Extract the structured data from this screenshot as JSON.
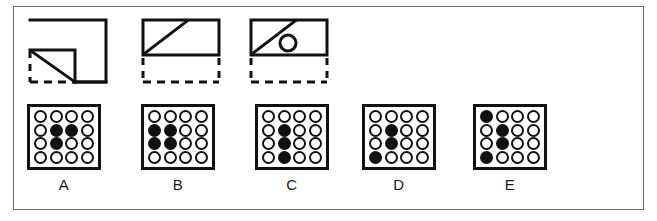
{
  "page": {
    "width": 657,
    "height": 221,
    "background": "#ffffff",
    "frame_color": "#6f6f6f",
    "ink_color": "#111111"
  },
  "prompt": {
    "name": "prompt-figure-sequence",
    "count": 3,
    "figures": [
      {
        "id": "figure-1",
        "description": "square outline with notched bottom-left corner, diagonal line across the notch, dashed lines completing the missing corner",
        "left": 22,
        "width": 88,
        "height": 72,
        "solid_parts": [
          "outer-square-top",
          "outer-square-right",
          "outer-square-bottom-right",
          "inner-notch-horizontal",
          "inner-notch-vertical",
          "diagonal"
        ],
        "dashed_parts": [
          "left-edge-lower",
          "bottom-edge-left"
        ],
        "has_circle": false
      },
      {
        "id": "figure-2",
        "description": "rectangle outline with diagonal line from bottom-left to top edge, dashed rectangle below",
        "left": 135,
        "width": 84,
        "height": 72,
        "solid_parts": [
          "rectangle",
          "diagonal"
        ],
        "dashed_parts": [
          "lower-box-left",
          "lower-box-right",
          "lower-box-bottom"
        ],
        "has_circle": false
      },
      {
        "id": "figure-3",
        "description": "rectangle outline with diagonal line and small circle, dashed rectangle below",
        "left": 243,
        "width": 84,
        "height": 72,
        "solid_parts": [
          "rectangle",
          "diagonal",
          "circle"
        ],
        "dashed_parts": [
          "lower-box-left",
          "lower-box-right",
          "lower-box-bottom"
        ],
        "has_circle": true
      }
    ]
  },
  "options": {
    "name": "answer-options",
    "grid_rows": 4,
    "grid_cols": 4,
    "legend": {
      "filled": "black dot",
      "empty": "white dot"
    },
    "items": [
      {
        "label": "A",
        "left": 22,
        "grid": [
          [
            0,
            0,
            0,
            0
          ],
          [
            0,
            1,
            1,
            0
          ],
          [
            0,
            1,
            0,
            0
          ],
          [
            0,
            0,
            0,
            0
          ]
        ]
      },
      {
        "label": "B",
        "left": 136,
        "grid": [
          [
            0,
            0,
            0,
            0
          ],
          [
            1,
            1,
            0,
            0
          ],
          [
            1,
            1,
            0,
            0
          ],
          [
            0,
            0,
            0,
            0
          ]
        ]
      },
      {
        "label": "C",
        "left": 250,
        "grid": [
          [
            0,
            0,
            0,
            0
          ],
          [
            0,
            1,
            0,
            0
          ],
          [
            0,
            1,
            0,
            0
          ],
          [
            0,
            1,
            0,
            0
          ]
        ]
      },
      {
        "label": "D",
        "left": 357,
        "grid": [
          [
            0,
            0,
            0,
            0
          ],
          [
            0,
            1,
            0,
            0
          ],
          [
            0,
            1,
            0,
            0
          ],
          [
            1,
            0,
            0,
            0
          ]
        ]
      },
      {
        "label": "E",
        "left": 468,
        "grid": [
          [
            1,
            0,
            0,
            0
          ],
          [
            0,
            1,
            0,
            0
          ],
          [
            0,
            1,
            0,
            0
          ],
          [
            1,
            0,
            0,
            0
          ]
        ]
      }
    ]
  }
}
